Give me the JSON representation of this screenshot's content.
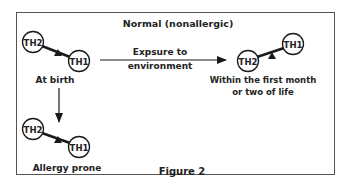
{
  "figure": {
    "title": "Normal (nonallergic)",
    "caption": "Figure 2",
    "colors": {
      "stroke": "#1a1a1a",
      "frame": "#555555",
      "background": "#ffffff"
    }
  },
  "nodes": {
    "at_birth": {
      "left": "TH2",
      "right": "TH1",
      "label": "At birth"
    },
    "later": {
      "left": "TH2",
      "right": "TH1",
      "label_line1": "Within the first month",
      "label_line2": "or two of life"
    },
    "allergy": {
      "left": "TH2",
      "right": "TH1",
      "label": "Allergy prone"
    }
  },
  "arrows": {
    "horizontal": {
      "label_line1": "Expsure to",
      "label_line2": "environment"
    },
    "vertical": {
      "label": ""
    }
  }
}
